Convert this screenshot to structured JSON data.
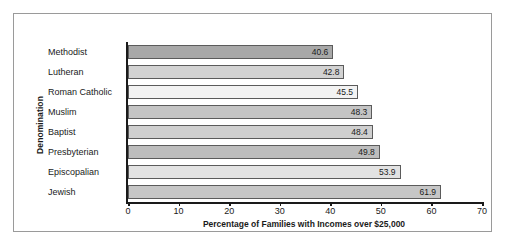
{
  "chart_data": {
    "type": "bar",
    "orientation": "horizontal",
    "title": "",
    "xlabel": "Percentage of Families with Incomes over $25,000",
    "ylabel": "Denomination",
    "xlim": [
      0,
      70
    ],
    "xticks": [
      0,
      10,
      20,
      30,
      40,
      50,
      60,
      70
    ],
    "grid": false,
    "legend": null,
    "categories": [
      "Methodist",
      "Lutheran",
      "Roman Catholic",
      "Muslim",
      "Baptist",
      "Presbyterian",
      "Episcopalian",
      "Jewish"
    ],
    "values": [
      40.6,
      42.8,
      45.5,
      48.3,
      48.4,
      49.8,
      53.9,
      61.9
    ],
    "value_labels": [
      "40.6",
      "42.8",
      "45.5",
      "48.3",
      "48.4",
      "49.8",
      "53.9",
      "61.9"
    ],
    "bar_colors": [
      "#a8a8a8",
      "#d2d2d2",
      "#f2f2f2",
      "#c4c4c4",
      "#cfcfcf",
      "#bdbdbd",
      "#e2e2e2",
      "#c6c6c6"
    ],
    "bar_border_color": "#5b5b5b",
    "axis_color": "#1a1a1a",
    "frame_border_color": "#9a9a9a",
    "background": "#ffffff"
  }
}
